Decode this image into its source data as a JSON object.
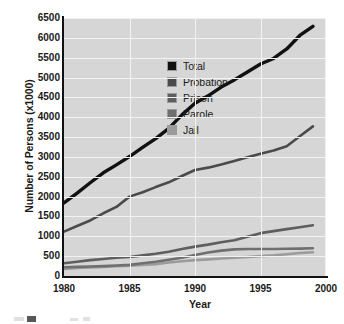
{
  "chart_data": {
    "type": "line",
    "title": "",
    "xlabel": "Year",
    "ylabel": "Number of Persons (x1000)",
    "xlim": [
      1980,
      2000
    ],
    "ylim": [
      0,
      6500
    ],
    "xticks": [
      1980,
      1985,
      1990,
      1995,
      2000
    ],
    "yticks": [
      0,
      500,
      1000,
      1500,
      2000,
      2500,
      3000,
      3500,
      4000,
      4500,
      5000,
      5500,
      6000,
      6500
    ],
    "grid": "white horizontal and vertical gridlines on light gray plot background",
    "legend_position": "inside upper-left of plot area",
    "x": [
      1980,
      1981,
      1982,
      1983,
      1984,
      1985,
      1986,
      1987,
      1988,
      1989,
      1990,
      1991,
      1992,
      1993,
      1994,
      1995,
      1996,
      1997,
      1998,
      1999
    ],
    "series": [
      {
        "name": "Total",
        "color": "#111111",
        "values": [
          1840,
          2090,
          2350,
          2600,
          2800,
          3010,
          3240,
          3460,
          3720,
          4060,
          4350,
          4540,
          4760,
          4940,
          5140,
          5340,
          5480,
          5720,
          6060,
          6290
        ]
      },
      {
        "name": "Probation",
        "color": "#4a4a4a",
        "values": [
          1120,
          1260,
          1400,
          1580,
          1740,
          2000,
          2110,
          2240,
          2360,
          2520,
          2670,
          2730,
          2810,
          2900,
          2990,
          3080,
          3160,
          3270,
          3520,
          3770
        ]
      },
      {
        "name": "Prison",
        "color": "#5e5e5e",
        "values": [
          320,
          360,
          400,
          430,
          460,
          480,
          520,
          560,
          610,
          680,
          740,
          790,
          850,
          900,
          990,
          1080,
          1130,
          1180,
          1230,
          1280
        ]
      },
      {
        "name": "Parole",
        "color": "#6f6f6f",
        "values": [
          220,
          230,
          240,
          250,
          265,
          280,
          320,
          360,
          410,
          460,
          530,
          590,
          640,
          670,
          680,
          680,
          680,
          685,
          690,
          700
        ]
      },
      {
        "name": "Jail",
        "color": "#9b9b9b",
        "values": [
          180,
          200,
          215,
          230,
          245,
          260,
          280,
          300,
          340,
          370,
          400,
          420,
          440,
          460,
          480,
          500,
          520,
          550,
          580,
          600
        ]
      }
    ]
  },
  "legend": {
    "items": [
      {
        "label": "Total",
        "swatch": "#111111"
      },
      {
        "label": "Probation",
        "swatch": "#4a4a4a"
      },
      {
        "label": "Prison",
        "swatch": "#5e5e5e"
      },
      {
        "label": "Parole",
        "swatch": "#6f6f6f"
      },
      {
        "label": "Jail",
        "swatch": "#9b9b9b"
      }
    ]
  },
  "axes": {
    "y_title": "Number of Persons (x1000)",
    "x_title": "Year",
    "y_labels": [
      "6500",
      "6000",
      "5500",
      "5000",
      "4500",
      "4000",
      "3500",
      "3000",
      "2500",
      "2000",
      "1500",
      "1000",
      "500",
      "0"
    ],
    "x_labels": [
      "1980",
      "1985",
      "1990",
      "1995",
      "2000"
    ]
  },
  "colors": {
    "plot_background": "#d6d6d6",
    "gridline": "#f2f2f2",
    "axis": "#111111",
    "text": "#1b1b1b",
    "page_background": "#ffffff"
  }
}
